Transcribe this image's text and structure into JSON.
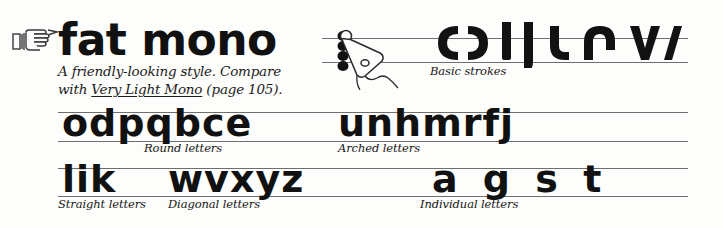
{
  "page": {
    "background_color": "#fdfdfb",
    "ink_color": "#111111",
    "rule_color": "#6e6e6e"
  },
  "header": {
    "manicule_icon": "pointing-hand-icon",
    "title": "fat mono",
    "description_line1": "A friendly-looking style. Compare",
    "description_line2_prefix": "with ",
    "description_cross_reference": "Very Light Mono",
    "description_line2_suffix": " (page 105)."
  },
  "pen_diagram": {
    "nib_icon": "pen-nib-icon",
    "pen_width_dots": 4,
    "dot_icon": "pen-width-dot-icon"
  },
  "sections": [
    {
      "id": "basic-strokes",
      "caption": "Basic strokes",
      "glyphs": [
        "c",
        "ɔ",
        "l",
        "j",
        "u",
        "n",
        "v",
        "/"
      ]
    },
    {
      "id": "round-letters",
      "caption": "Round letters",
      "letters": "odpqbce"
    },
    {
      "id": "arched-letters",
      "caption": "Arched letters",
      "letters": "unhmrfj"
    },
    {
      "id": "straight-letters",
      "caption": "Straight letters",
      "letters": "lik"
    },
    {
      "id": "diagonal-letters",
      "caption": "Diagonal letters",
      "letters": "wvxyz"
    },
    {
      "id": "individual-letters",
      "caption": "Individual letters",
      "letters": "a g s t"
    }
  ]
}
